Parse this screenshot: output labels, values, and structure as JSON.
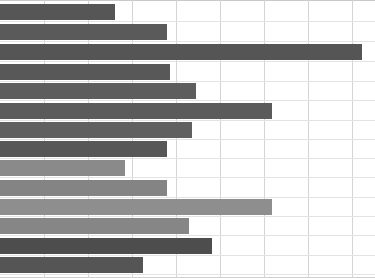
{
  "chart_data": {
    "type": "bar",
    "orientation": "horizontal",
    "title": "",
    "subtitle": "",
    "xlabel": "",
    "ylabel": "",
    "categories": [
      "",
      "",
      "",
      "",
      "",
      "",
      "",
      "",
      "",
      "",
      "",
      "",
      "",
      ""
    ],
    "values": [
      115,
      167,
      362,
      170,
      196,
      272,
      192,
      167,
      125,
      167,
      272,
      189,
      212,
      143
    ],
    "xlim": [
      0,
      375
    ],
    "grid": true,
    "grid_axis": "x",
    "gridline_values": [
      44,
      88,
      132,
      176,
      220,
      264,
      308,
      352
    ],
    "legend": "none",
    "tick_labels": [],
    "annotations": [],
    "bar_colors": [
      "#565656",
      "#5a5a5a",
      "#555555",
      "#585858",
      "#5d5d5d",
      "#5b5b5b",
      "#606060",
      "#575757",
      "#8a8a8a",
      "#848484",
      "#8e8e8e",
      "#868686",
      "#4d4d4d",
      "#555555"
    ]
  },
  "style": {
    "background": "#ffffff",
    "gridline_color": "#d4d4d4",
    "dark_bar": "#4d4d4d",
    "light_bar": "#8a8a8a"
  },
  "geometry": {
    "rows": [
      {
        "top": 4,
        "height": 16
      },
      {
        "top": 24,
        "height": 16
      },
      {
        "top": 44,
        "height": 16
      },
      {
        "top": 64,
        "height": 16
      },
      {
        "top": 83,
        "height": 16
      },
      {
        "top": 103,
        "height": 16
      },
      {
        "top": 122,
        "height": 16
      },
      {
        "top": 141,
        "height": 16
      },
      {
        "top": 160,
        "height": 16
      },
      {
        "top": 180,
        "height": 16
      },
      {
        "top": 199,
        "height": 16
      },
      {
        "top": 218,
        "height": 16
      },
      {
        "top": 238,
        "height": 16
      },
      {
        "top": 257,
        "height": 16
      }
    ]
  }
}
